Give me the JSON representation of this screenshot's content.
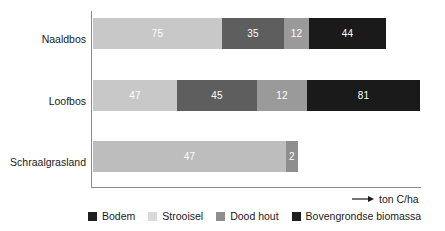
{
  "chart_data": {
    "type": "bar",
    "orientation": "horizontal",
    "stacked": true,
    "title": "",
    "subtitle": "",
    "xlabel": "ton C/ha",
    "ylabel": "",
    "grid": false,
    "legend_position": "bottom",
    "categories": [
      "Naaldbos",
      "Loofbos",
      "Schraalgrasland"
    ],
    "series": [
      {
        "name": "Strooisel",
        "color": "#c8c8c8",
        "values": [
          75,
          47,
          47
        ]
      },
      {
        "name": "Dood hout",
        "color": "#5e5e5e",
        "values": [
          35,
          45,
          null
        ]
      },
      {
        "name": "Bodem",
        "color": "#9a9a9a",
        "values": [
          12,
          12,
          2
        ]
      },
      {
        "name": "Bovengrondse biomassa",
        "color": "#1a1a1a",
        "values": [
          44,
          81,
          null
        ]
      }
    ],
    "totals": [
      166,
      185,
      49
    ]
  },
  "axis": {
    "unit_label": "ton C/ha",
    "arrow_icon": "arrow-right-icon"
  },
  "rows": [
    {
      "label": "Naaldbos",
      "segments": [
        {
          "value": "75",
          "color": "#c8c8c8",
          "width": 129,
          "name": "strooisel"
        },
        {
          "value": "35",
          "color": "#5e5e5e",
          "width": 62,
          "name": "dood-hout"
        },
        {
          "value": "12",
          "color": "#9a9a9a",
          "width": 25,
          "name": "bodem"
        },
        {
          "value": "44",
          "color": "#1a1a1a",
          "width": 77,
          "name": "bovengrondse-biomassa"
        }
      ]
    },
    {
      "label": "Loofbos",
      "segments": [
        {
          "value": "47",
          "color": "#c8c8c8",
          "width": 84,
          "name": "strooisel"
        },
        {
          "value": "45",
          "color": "#5e5e5e",
          "width": 80,
          "name": "dood-hout"
        },
        {
          "value": "12",
          "color": "#9a9a9a",
          "width": 50,
          "name": "bodem"
        },
        {
          "value": "81",
          "color": "#1a1a1a",
          "width": 113,
          "name": "bovengrondse-biomassa"
        }
      ]
    },
    {
      "label": "Schraalgrasland",
      "segments": [
        {
          "value": "47",
          "color": "#bdbdbd",
          "width": 193,
          "name": "strooisel"
        },
        {
          "value": "2",
          "color": "#8e8e8e",
          "width": 12,
          "name": "bodem"
        }
      ]
    }
  ],
  "legend": {
    "items": [
      {
        "label": "Bodem",
        "color": "#1f1f1f"
      },
      {
        "label": "Strooisel",
        "color": "#d9d9d9"
      },
      {
        "label": "Dood hout",
        "color": "#8e8e8e"
      },
      {
        "label": "Bovengrondse biomassa",
        "color": "#1f1f1f"
      }
    ]
  }
}
